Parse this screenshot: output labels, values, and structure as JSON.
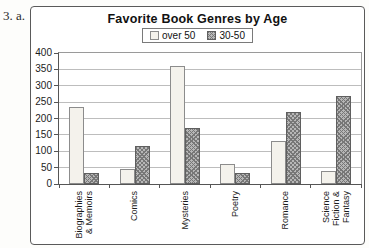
{
  "page": {
    "problem_label": "3. a."
  },
  "chart_data": {
    "type": "bar",
    "title": "Favorite Book Genres by Age",
    "categories": [
      "Biographies\n& Memoirs",
      "Comics",
      "Mysteries",
      "Poetry",
      "Romance",
      "Science\nFiction &\nFantasy"
    ],
    "series": [
      {
        "name": "over 50",
        "values": [
          235,
          45,
          360,
          60,
          130,
          40
        ]
      },
      {
        "name": "30-50",
        "values": [
          35,
          115,
          170,
          35,
          220,
          270
        ]
      }
    ],
    "xlabel": "",
    "ylabel": "",
    "ylim": [
      0,
      400
    ],
    "ytick_step": 50,
    "grid": true,
    "legend_position": "top-center",
    "colors": {
      "over50_fill": "#f4f2ec",
      "over50_border": "#8c8c8c",
      "age3050_fill": "#b7b7b7",
      "age3050_dot": "#777777",
      "age3050_border": "#5f5f5f",
      "gridline": "#bdbdbd",
      "axis": "#555555",
      "plot_border": "#9a9a9a"
    }
  }
}
